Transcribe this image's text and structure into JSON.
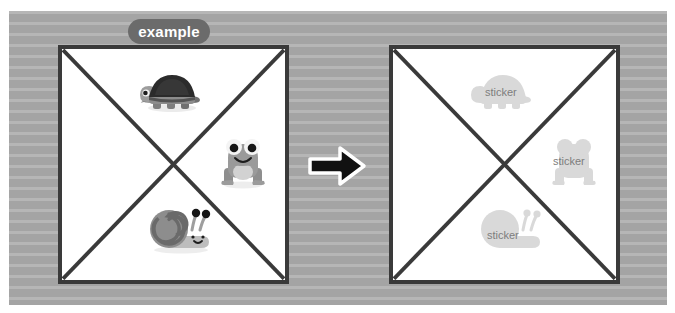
{
  "image": {
    "width": 675,
    "height": 313,
    "background_color": "#ffffff",
    "backdrop_color": "#a8a8a8",
    "backdrop_stripe_color": "#b6b6b6"
  },
  "badge": {
    "label": "example",
    "background_color": "#6b6b6b",
    "text_color": "#ffffff"
  },
  "arrow": {
    "name": "right-arrow-icon",
    "direction": "right",
    "fill_color": "#111111",
    "outline_color": "#ffffff"
  },
  "panels": [
    {
      "id": "left",
      "name": "source-panel",
      "border_color": "#3a3a3a",
      "fill_color": "#ffffff",
      "diagonals": "both",
      "items": [
        {
          "name": "turtle-sticker",
          "label": "",
          "position": "top",
          "colors": [
            "#2b2b2b",
            "#9a9a9a",
            "#6f6f6f"
          ]
        },
        {
          "name": "frog-sticker",
          "label": "",
          "position": "right",
          "colors": [
            "#8f8f8f",
            "#ffffff",
            "#1a1a1a"
          ]
        },
        {
          "name": "snail-sticker",
          "label": "",
          "position": "bottom",
          "colors": [
            "#8a8a8a",
            "#b5b5b5",
            "#1a1a1a"
          ]
        }
      ]
    },
    {
      "id": "right",
      "name": "target-panel",
      "border_color": "#3a3a3a",
      "fill_color": "#ffffff",
      "diagonals": "both",
      "items": [
        {
          "name": "turtle-placeholder",
          "label": "sticker",
          "position": "top",
          "fill_color": "#d9d9d9",
          "text_color": "#7d7d7d"
        },
        {
          "name": "frog-placeholder",
          "label": "sticker",
          "position": "right",
          "fill_color": "#d9d9d9",
          "text_color": "#7d7d7d"
        },
        {
          "name": "snail-placeholder",
          "label": "sticker",
          "position": "bottom",
          "fill_color": "#d9d9d9",
          "text_color": "#7d7d7d"
        }
      ]
    }
  ]
}
